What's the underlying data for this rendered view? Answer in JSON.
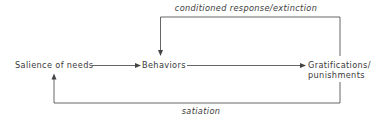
{
  "diagram": {
    "nodes": {
      "salience": "Salience of needs",
      "behaviors": "Behaviors",
      "gratifications_line1": "Gratifications/",
      "gratifications_line2": "punishments"
    },
    "edges": {
      "feedback_top": "conditioned response/extinction",
      "feedback_bottom": "satiation"
    },
    "colors": {
      "line": "#555555",
      "text": "#3a3a3a",
      "background": "#ffffff"
    }
  }
}
